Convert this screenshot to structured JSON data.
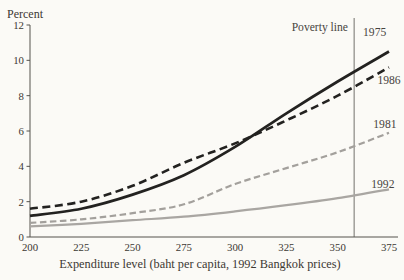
{
  "chart_data": {
    "type": "line",
    "title": "",
    "ylabel": "Percent",
    "xlabel": "Expenditure level (baht per capita, 1992 Bangkok prices)",
    "x": [
      200,
      225,
      250,
      275,
      300,
      325,
      350,
      375
    ],
    "y_ticks": [
      0,
      2,
      4,
      6,
      8,
      10,
      12
    ],
    "xlim": [
      200,
      375
    ],
    "ylim": [
      0,
      12
    ],
    "grid": false,
    "legend_position": "end-of-line-labels",
    "axis_color": "#55524d",
    "series": [
      {
        "name": "1975",
        "line": "solid",
        "color": "#232220",
        "width": 2.7,
        "dash": "",
        "values": [
          1.2,
          1.6,
          2.4,
          3.5,
          5.1,
          7.0,
          8.8,
          10.5
        ],
        "label_pos": {
          "x": 368,
          "y": 11.6
        }
      },
      {
        "name": "1986",
        "line": "dashed",
        "color": "#232220",
        "width": 2.6,
        "dash": "8 4.5",
        "values": [
          1.6,
          2.0,
          2.9,
          4.2,
          5.3,
          6.6,
          8.0,
          9.6
        ],
        "label_pos": {
          "x": 375,
          "y": 8.9
        }
      },
      {
        "name": "1981",
        "line": "dashed",
        "color": "#a3a09c",
        "width": 2.2,
        "dash": "6.5 3.5",
        "values": [
          0.8,
          1.0,
          1.35,
          1.85,
          3.0,
          3.9,
          4.8,
          5.9
        ],
        "label_pos": {
          "x": 373,
          "y": 6.4
        }
      },
      {
        "name": "1992",
        "line": "solid",
        "color": "#a9a6a2",
        "width": 2.2,
        "dash": "",
        "values": [
          0.6,
          0.75,
          0.95,
          1.15,
          1.45,
          1.8,
          2.2,
          2.7
        ],
        "label_pos": {
          "x": 372,
          "y": 3.0
        }
      }
    ],
    "poverty_line": {
      "x": 358,
      "label": "Poverty line",
      "color": "#72706b"
    }
  }
}
